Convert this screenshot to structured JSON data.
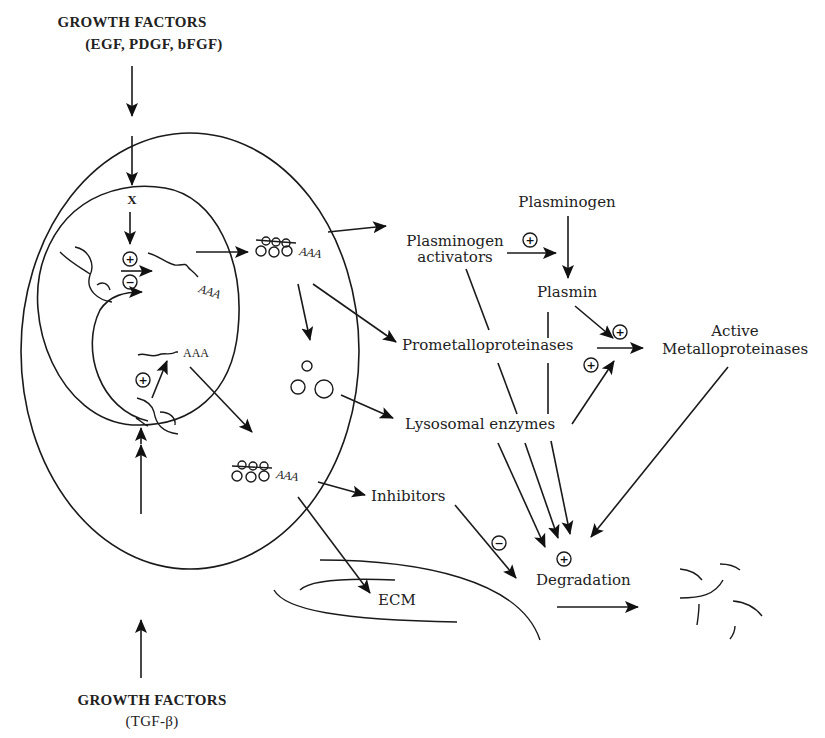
{
  "diagram": {
    "top_input": {
      "title": "GROWTH FACTORS",
      "subtitle": "(EGF, PDGF, bFGF)"
    },
    "bottom_input": {
      "title": "GROWTH FACTORS",
      "subtitle": "(TGF-β)"
    },
    "nucleus": {
      "factor_label": "X",
      "mrna_label_1": "AAA",
      "mrna_label_2": "AAA",
      "signs": {
        "activate": "+",
        "repress": "−",
        "induce": "+"
      }
    },
    "cytoplasm": {
      "polysome_1_label": "AAA",
      "polysome_2_label": "AAA"
    },
    "products": {
      "plasminogen": "Plasminogen",
      "plasminogen_activators_line1": "Plasminogen",
      "plasminogen_activators_line2": "activators",
      "plasmin": "Plasmin",
      "prometalloproteinases": "Prometalloproteinases",
      "active_mmp_line1": "Active",
      "active_mmp_line2": "Metalloproteinases",
      "lysosomal_enzymes": "Lysosomal enzymes",
      "inhibitors": "Inhibitors",
      "ecm": "ECM",
      "degradation": "Degradation"
    },
    "signs": {
      "pa_to_plasmin": "+",
      "plasmin_to_mmp": "+",
      "lyso_to_mmp": "+",
      "inhibitor_to_degradation": "−",
      "degradation": "+"
    }
  }
}
